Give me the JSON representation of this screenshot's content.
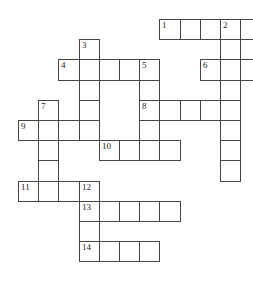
{
  "puzzle": {
    "type": "crossword",
    "cell_size": 20.2,
    "origin": {
      "x": 18,
      "y": 19
    },
    "cells": [
      {
        "r": 0,
        "c": 7,
        "n": "1"
      },
      {
        "r": 0,
        "c": 8
      },
      {
        "r": 0,
        "c": 9
      },
      {
        "r": 0,
        "c": 10,
        "n": "2"
      },
      {
        "r": 0,
        "c": 11
      },
      {
        "r": 1,
        "c": 3,
        "n": "3"
      },
      {
        "r": 1,
        "c": 10
      },
      {
        "r": 2,
        "c": 2,
        "n": "4"
      },
      {
        "r": 2,
        "c": 3
      },
      {
        "r": 2,
        "c": 4
      },
      {
        "r": 2,
        "c": 5
      },
      {
        "r": 2,
        "c": 6,
        "n": "5"
      },
      {
        "r": 2,
        "c": 9,
        "n": "6"
      },
      {
        "r": 2,
        "c": 10
      },
      {
        "r": 2,
        "c": 11
      },
      {
        "r": 3,
        "c": 3
      },
      {
        "r": 3,
        "c": 6
      },
      {
        "r": 3,
        "c": 10
      },
      {
        "r": 4,
        "c": 1,
        "n": "7"
      },
      {
        "r": 4,
        "c": 3
      },
      {
        "r": 4,
        "c": 6,
        "n": "8"
      },
      {
        "r": 4,
        "c": 7
      },
      {
        "r": 4,
        "c": 8
      },
      {
        "r": 4,
        "c": 9
      },
      {
        "r": 4,
        "c": 10
      },
      {
        "r": 5,
        "c": 0,
        "n": "9"
      },
      {
        "r": 5,
        "c": 1
      },
      {
        "r": 5,
        "c": 2
      },
      {
        "r": 5,
        "c": 3
      },
      {
        "r": 5,
        "c": 6
      },
      {
        "r": 5,
        "c": 10
      },
      {
        "r": 6,
        "c": 1
      },
      {
        "r": 6,
        "c": 4,
        "n": "10"
      },
      {
        "r": 6,
        "c": 5
      },
      {
        "r": 6,
        "c": 6
      },
      {
        "r": 6,
        "c": 7
      },
      {
        "r": 6,
        "c": 10
      },
      {
        "r": 7,
        "c": 1
      },
      {
        "r": 7,
        "c": 10
      },
      {
        "r": 8,
        "c": 0,
        "n": "11"
      },
      {
        "r": 8,
        "c": 1
      },
      {
        "r": 8,
        "c": 2
      },
      {
        "r": 8,
        "c": 3,
        "n": "12"
      },
      {
        "r": 9,
        "c": 3,
        "n": "13"
      },
      {
        "r": 9,
        "c": 4
      },
      {
        "r": 9,
        "c": 5
      },
      {
        "r": 9,
        "c": 6
      },
      {
        "r": 9,
        "c": 7
      },
      {
        "r": 10,
        "c": 3
      },
      {
        "r": 11,
        "c": 3,
        "n": "14"
      },
      {
        "r": 11,
        "c": 4
      },
      {
        "r": 11,
        "c": 5
      },
      {
        "r": 11,
        "c": 6
      }
    ]
  }
}
